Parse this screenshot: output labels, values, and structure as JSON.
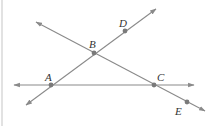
{
  "diagram": {
    "type": "geometry-lines",
    "colors": {
      "line": "#8a8a8a",
      "point": "#7a7a7a",
      "label": "#333333",
      "edge": "#e2e2e2"
    },
    "points": [
      {
        "name": "A",
        "x": 51,
        "y": 85,
        "label_x": 45,
        "label_y": 81
      },
      {
        "name": "B",
        "x": 94,
        "y": 53,
        "label_x": 89,
        "label_y": 48
      },
      {
        "name": "C",
        "x": 154,
        "y": 85,
        "label_x": 157,
        "label_y": 81
      },
      {
        "name": "D",
        "x": 125,
        "y": 31,
        "label_x": 119,
        "label_y": 27
      },
      {
        "name": "E",
        "x": 187,
        "y": 102,
        "label_x": 175,
        "label_y": 115
      }
    ],
    "lines": [
      {
        "name": "line-AC",
        "x1": 14,
        "y1": 85,
        "x2": 194,
        "y2": 85,
        "through": [
          "A",
          "C"
        ]
      },
      {
        "name": "line-AD",
        "x1": 26,
        "y1": 105,
        "x2": 156,
        "y2": 9,
        "through": [
          "A",
          "B",
          "D"
        ]
      },
      {
        "name": "line-BE",
        "x1": 36,
        "y1": 22,
        "x2": 205,
        "y2": 111,
        "through": [
          "B",
          "C",
          "E"
        ]
      }
    ]
  }
}
